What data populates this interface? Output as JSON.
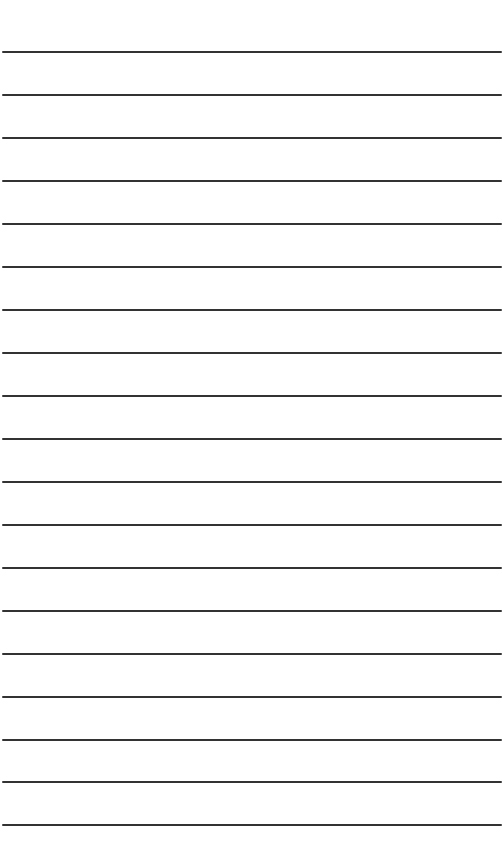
{
  "page": {
    "type": "lined-paper",
    "background": "#ffffff",
    "line_color": "#333333",
    "line_count": 19,
    "line_positions_y": [
      52,
      95,
      138,
      181,
      224,
      267,
      310,
      353,
      396,
      439,
      482,
      525,
      568,
      611,
      654,
      697,
      740,
      782,
      825
    ]
  }
}
